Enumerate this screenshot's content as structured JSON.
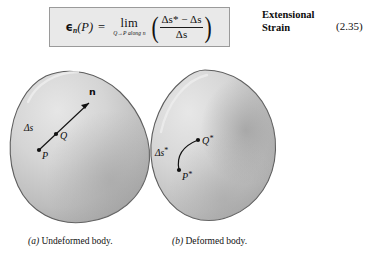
{
  "equation": {
    "lhs_symbol": "ϵ",
    "lhs_subscript": "n",
    "lhs_arg": "(P)",
    "equals": "=",
    "limit_op": "lim",
    "limit_sub": "Q→P along n",
    "numerator": "Δs* − Δs",
    "denominator": "Δs",
    "full_text": "ϵₙ(P) = lim (Q→P along n) ( (Δs* − Δs) / Δs )",
    "label_line1": "Extensional",
    "label_line2": "Strain",
    "number": "(2.35)"
  },
  "figure": {
    "panel_a": {
      "caption_tag": "(a)",
      "caption_text": "Undeformed body.",
      "point_p": "P",
      "point_q": "Q",
      "arc_label": "Δs",
      "normal_label": "n"
    },
    "panel_b": {
      "caption_tag": "(b)",
      "caption_text": "Deformed body.",
      "point_p": "P*",
      "point_q": "Q*",
      "arc_label": "Δs*"
    }
  },
  "colors": {
    "page_background": "#ffffff",
    "equation_box_fill": "#e9e9e9",
    "equation_box_border": "#9a9a9a",
    "body_fill_light": "#dcdcdc",
    "body_fill_mid": "#c4c4c4",
    "body_fill_dark": "#a9a9a9",
    "body_outline": "#5a5a5a",
    "text": "#111111"
  }
}
